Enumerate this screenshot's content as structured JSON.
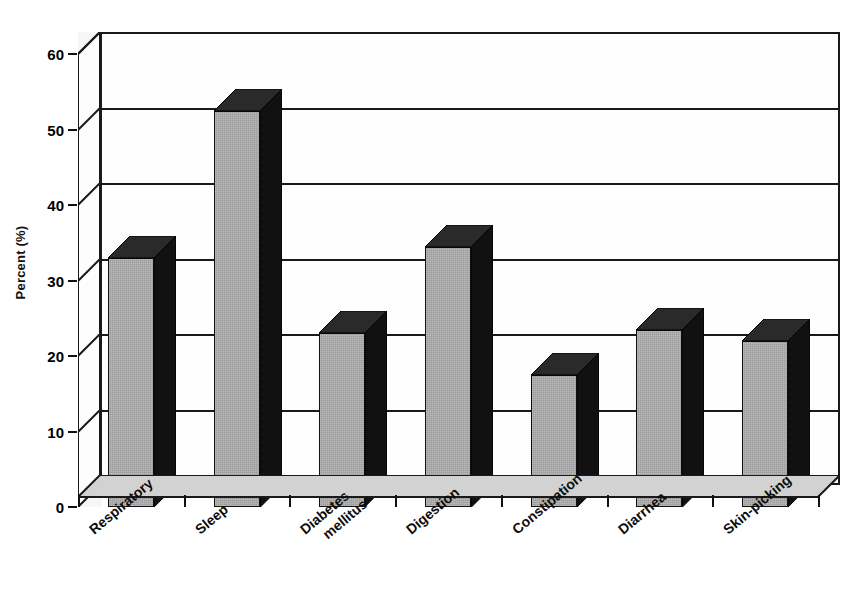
{
  "chart_data": {
    "type": "bar",
    "title": "",
    "xlabel": "",
    "ylabel": "Percent (%)",
    "ylim": [
      0,
      60
    ],
    "ytick_values": [
      0,
      10,
      20,
      30,
      40,
      50,
      60
    ],
    "ytick_labels": [
      "0",
      "10",
      "20",
      "30",
      "40",
      "50",
      "60"
    ],
    "grid": true,
    "legend": "none",
    "style": "3d-bar-grayscale",
    "categories": [
      "Respiratory",
      "Sleep",
      "Diabetes mellitus",
      "Digestion",
      "Constipation",
      "Diarrhea",
      "Skin-picking"
    ],
    "values": [
      33,
      52.5,
      23,
      34.5,
      17.5,
      23.5,
      22
    ],
    "bars": [
      {
        "label": "Respiratory",
        "value": 33,
        "label_lines": [
          "Respiratory"
        ]
      },
      {
        "label": "Sleep",
        "value": 52.5,
        "label_lines": [
          "Sleep"
        ]
      },
      {
        "label": "Diabetes mellitus",
        "value": 23,
        "label_lines": [
          "Diabetes",
          "mellitus"
        ]
      },
      {
        "label": "Digestion",
        "value": 34.5,
        "label_lines": [
          "Digestion"
        ]
      },
      {
        "label": "Constipation",
        "value": 17.5,
        "label_lines": [
          "Constipation"
        ]
      },
      {
        "label": "Diarrhea",
        "value": 23.5,
        "label_lines": [
          "Diarrhea"
        ]
      },
      {
        "label": "Skin-picking",
        "value": 22,
        "label_lines": [
          "Skin-picking"
        ]
      }
    ],
    "colors": {
      "bar_face": "#a8a8a8",
      "bar_side": "#111111",
      "bar_top": "#2a2a2a",
      "axis": "#1a1a1a",
      "background": "#ffffff",
      "floor": "#cfcfcf"
    }
  }
}
